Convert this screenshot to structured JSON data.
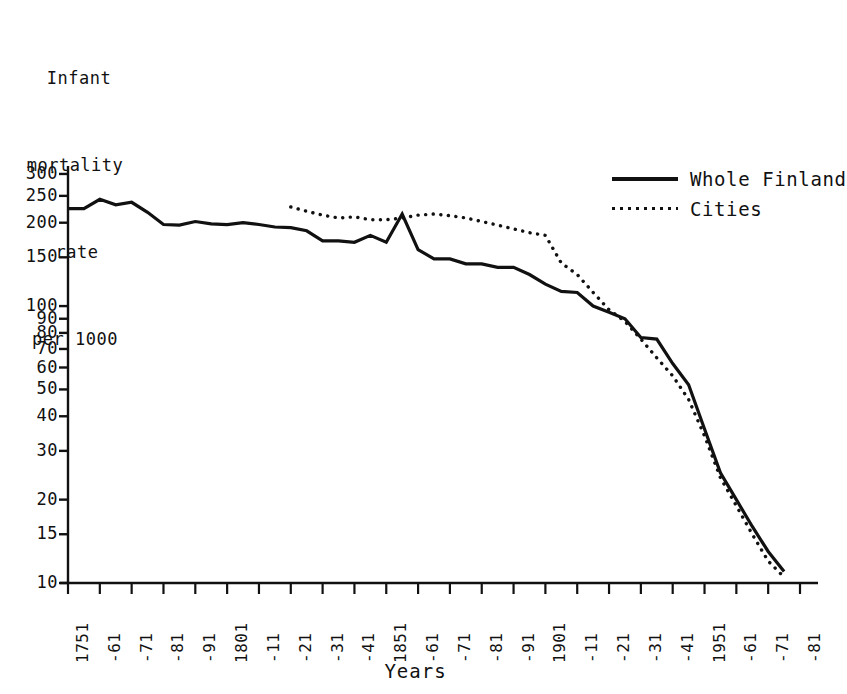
{
  "axis_caption": {
    "line1": "Infant",
    "line2": "mortality",
    "line3": "rate",
    "line4": "per 1000"
  },
  "x_title": "Years",
  "legend": {
    "position": "top-right",
    "entries": [
      {
        "label": "Whole Finland",
        "style": "solid"
      },
      {
        "label": "Cities",
        "style": "dotted"
      }
    ]
  },
  "colors": {
    "ink": "#111111",
    "background": "#ffffff"
  },
  "chart_data": {
    "type": "line",
    "title": "",
    "subtitle": "",
    "xlabel": "Years",
    "ylabel": "Infant mortality rate per 1000",
    "yscale": "log",
    "ylim": [
      10,
      310
    ],
    "xlim": [
      1751,
      1981
    ],
    "grid": false,
    "legend_position": "top-right",
    "ytick_labels": [
      "300",
      "250",
      "200",
      "150",
      "100",
      "90",
      "80",
      "70",
      "60",
      "50",
      "40",
      "30",
      "20",
      "15",
      "10"
    ],
    "ytick_values": [
      300,
      250,
      200,
      150,
      100,
      90,
      80,
      70,
      60,
      50,
      40,
      30,
      20,
      15,
      10
    ],
    "xtick_labels": [
      "1751",
      "-61",
      "-71",
      "-81",
      "-91",
      "1801",
      "-11",
      "-21",
      "-31",
      "-41",
      "1851",
      "-61",
      "-71",
      "-81",
      "-91",
      "1901",
      "-11",
      "-21",
      "-31",
      "-41",
      "1951",
      "-61",
      "-71",
      "-81"
    ],
    "xtick_values": [
      1751,
      1761,
      1771,
      1781,
      1791,
      1801,
      1811,
      1821,
      1831,
      1841,
      1851,
      1861,
      1871,
      1881,
      1891,
      1901,
      1911,
      1921,
      1931,
      1941,
      1951,
      1961,
      1971,
      1981
    ],
    "series": [
      {
        "name": "Whole Finland",
        "style": "solid",
        "x": [
          1751,
          1756,
          1761,
          1766,
          1771,
          1776,
          1781,
          1786,
          1791,
          1796,
          1801,
          1806,
          1811,
          1816,
          1821,
          1826,
          1831,
          1836,
          1841,
          1846,
          1851,
          1856,
          1861,
          1866,
          1871,
          1876,
          1881,
          1886,
          1891,
          1896,
          1901,
          1906,
          1911,
          1916,
          1921,
          1926,
          1931,
          1936,
          1941,
          1946,
          1951,
          1956,
          1961,
          1966,
          1971,
          1976
        ],
        "y": [
          225,
          225,
          243,
          232,
          237,
          218,
          197,
          196,
          202,
          198,
          197,
          200,
          197,
          193,
          192,
          187,
          172,
          172,
          170,
          180,
          170,
          215,
          160,
          148,
          148,
          142,
          142,
          138,
          138,
          130,
          120,
          113,
          112,
          100,
          95,
          90,
          77,
          76,
          62,
          52,
          36,
          25,
          20,
          16,
          13,
          11
        ]
      },
      {
        "name": "Cities",
        "style": "dotted",
        "x": [
          1821,
          1826,
          1831,
          1836,
          1841,
          1846,
          1851,
          1856,
          1861,
          1866,
          1871,
          1876,
          1881,
          1886,
          1891,
          1896,
          1901,
          1906,
          1911,
          1916,
          1921,
          1926,
          1931,
          1936,
          1941,
          1946,
          1951,
          1956,
          1961,
          1966,
          1971,
          1976
        ],
        "y": [
          228,
          220,
          213,
          208,
          210,
          205,
          205,
          208,
          213,
          215,
          212,
          208,
          202,
          196,
          190,
          184,
          180,
          143,
          130,
          112,
          97,
          88,
          76,
          65,
          56,
          46,
          34,
          24,
          19,
          15,
          12,
          10.5
        ]
      }
    ]
  }
}
